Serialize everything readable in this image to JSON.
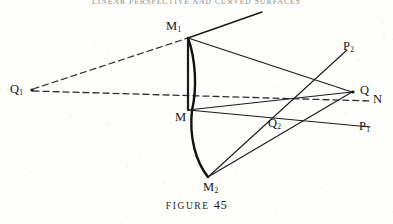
{
  "page": {
    "running_head": "LINEAR PERSPECTIVE AND CURVED SURFACES",
    "background_color": "#fdfdfc",
    "ink_color": "#161616"
  },
  "caption": {
    "word": "FIGURE",
    "number": "45"
  },
  "labels": [
    {
      "id": "Q1",
      "base": "Q",
      "sub": "1",
      "x": 10,
      "y": 83,
      "has_point_marker": true,
      "marker_x": 32,
      "marker_y": 90
    },
    {
      "id": "M1",
      "base": "M",
      "sub": "1",
      "x": 166,
      "y": 20,
      "has_point_marker": false,
      "marker_x": 188,
      "marker_y": 38
    },
    {
      "id": "M",
      "base": "M",
      "sub": "",
      "x": 175,
      "y": 111,
      "has_point_marker": false,
      "marker_x": 188,
      "marker_y": 110
    },
    {
      "id": "M2",
      "base": "M",
      "sub": "2",
      "x": 203,
      "y": 181,
      "has_point_marker": false,
      "marker_x": 208,
      "marker_y": 177
    },
    {
      "id": "P2",
      "base": "P",
      "sub": "2",
      "x": 343,
      "y": 40,
      "has_point_marker": false,
      "marker_x": 338,
      "marker_y": 54
    },
    {
      "id": "Q",
      "base": "Q",
      "sub": "",
      "x": 360,
      "y": 84,
      "has_point_marker": true,
      "marker_x": 353,
      "marker_y": 92
    },
    {
      "id": "N",
      "base": "N",
      "sub": "",
      "x": 373,
      "y": 93,
      "has_point_marker": false,
      "marker_x": 371,
      "marker_y": 101
    },
    {
      "id": "Q2",
      "base": "Q",
      "sub": "2",
      "x": 268,
      "y": 117,
      "has_point_marker": false,
      "marker_x": 274,
      "marker_y": 124
    },
    {
      "id": "P1",
      "base": "P",
      "sub": "1",
      "x": 359,
      "y": 120,
      "has_point_marker": false,
      "marker_x": 355,
      "marker_y": 131
    }
  ],
  "geometry": {
    "solid_lines": [
      {
        "name": "m1-upper-ray",
        "x1": 188,
        "y1": 38,
        "x2": 262,
        "y2": 12,
        "width": 1.35
      },
      {
        "name": "m1-to-q",
        "x1": 188,
        "y1": 38,
        "x2": 352,
        "y2": 92,
        "width": 1.1
      },
      {
        "name": "m-to-q",
        "x1": 188,
        "y1": 110,
        "x2": 352,
        "y2": 92,
        "width": 1.0
      },
      {
        "name": "m-to-p1",
        "x1": 188,
        "y1": 110,
        "x2": 370,
        "y2": 127,
        "width": 1.0
      },
      {
        "name": "m2-to-q",
        "x1": 208,
        "y1": 177,
        "x2": 352,
        "y2": 92,
        "width": 1.1
      },
      {
        "name": "m2-to-p2",
        "x1": 208,
        "y1": 177,
        "x2": 347,
        "y2": 50,
        "width": 1.1
      },
      {
        "name": "m1-to-m-chord",
        "x1": 188,
        "y1": 38,
        "x2": 188,
        "y2": 110,
        "width": 2.2
      }
    ],
    "arcs": [
      {
        "name": "meridian-arc-upper",
        "d": "M 188 38 C 196 60 197 90 192 110",
        "width": 2.4
      },
      {
        "name": "meridian-arc-lower",
        "d": "M 192 110 C 189 138 196 162 208 177",
        "width": 2.4
      }
    ],
    "dashed_lines": [
      {
        "name": "q1-to-m1-dashed",
        "x1": 33,
        "y1": 89,
        "x2": 188,
        "y2": 38,
        "dash": "6 4"
      },
      {
        "name": "q1-to-n-dashed",
        "x1": 33,
        "y1": 91,
        "x2": 371,
        "y2": 101,
        "dash": "6 4"
      }
    ]
  }
}
